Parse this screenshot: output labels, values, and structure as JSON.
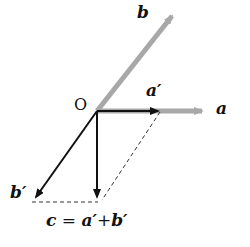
{
  "diagram": {
    "origin_label": "O",
    "labels": {
      "a": "a",
      "b": "b",
      "a_prime": "a′",
      "b_prime": "b′"
    },
    "equation": {
      "lhs": "c",
      "equals": " = ",
      "term1": "a′",
      "plus": "+",
      "term2": "b′"
    },
    "colors": {
      "gray_vector": "#a8a8a8",
      "black_vector": "#111111",
      "dashed": "#333333"
    }
  }
}
